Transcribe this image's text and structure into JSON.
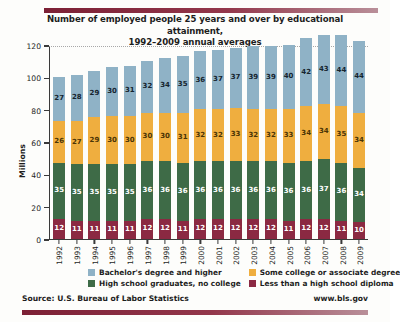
{
  "chart_data": {
    "type": "bar",
    "subtype": "stacked-column",
    "title": "Number of employed people 25 years and over by educational attainment, 1992–2009 annual averages",
    "title_line1": "Number of employed people 25 years and over by educational attainment,",
    "title_line2": "1992–2009 annual averages",
    "xlabel": "",
    "ylabel": "Millions",
    "ylim": [
      0,
      120
    ],
    "yticks": [
      0,
      20,
      40,
      60,
      80,
      100,
      120
    ],
    "ytick_labels": [
      "0",
      "20",
      "40",
      "60",
      "80",
      "100",
      "120"
    ],
    "grid": "horizontal-dotted",
    "legend_position": "bottom",
    "categories": [
      "1992",
      "1993",
      "1994",
      "1995",
      "1996",
      "1997",
      "1998",
      "1999",
      "2000",
      "2001",
      "2002",
      "2003",
      "2004",
      "2005",
      "2006",
      "2007",
      "2008",
      "2009"
    ],
    "series": [
      {
        "name": "Less than a high school diploma",
        "color": "#8b2942",
        "stack_order": 1,
        "values": [
          12,
          11,
          11,
          11,
          11,
          12,
          12,
          11,
          12,
          12,
          12,
          12,
          12,
          11,
          12,
          12,
          11,
          10
        ]
      },
      {
        "name": "High school graduates, no college",
        "color": "#3e6b47",
        "stack_order": 2,
        "values": [
          35,
          35,
          35,
          35,
          35,
          36,
          36,
          36,
          36,
          36,
          36,
          36,
          36,
          36,
          36,
          37,
          36,
          34
        ]
      },
      {
        "name": "Some college or associate degree",
        "color": "#efae3f",
        "stack_order": 3,
        "values": [
          26,
          27,
          29,
          30,
          30,
          30,
          30,
          31,
          32,
          32,
          33,
          32,
          32,
          33,
          34,
          34,
          35,
          34
        ]
      },
      {
        "name": "Bachelor's degree and higher",
        "color": "#8fb2c6",
        "stack_order": 4,
        "values": [
          27,
          28,
          29,
          30,
          31,
          32,
          34,
          35,
          36,
          37,
          37,
          39,
          39,
          40,
          42,
          43,
          44,
          44
        ]
      }
    ],
    "totals": [
      100,
      101,
      104,
      106,
      107,
      110,
      112,
      113,
      116,
      117,
      118,
      119,
      119,
      120,
      124,
      126,
      126,
      122
    ]
  },
  "legend": {
    "items": [
      {
        "label": "Bachelor's degree and higher",
        "color": "#8fb2c6"
      },
      {
        "label": "Some college or associate degree",
        "color": "#efae3f"
      },
      {
        "label": "High school graduates, no college",
        "color": "#3e6b47"
      },
      {
        "label": "Less than a high school diploma",
        "color": "#8b2942"
      }
    ]
  },
  "footer": {
    "source": "Source: U.S. Bureau of Labor Statistics",
    "url": "www.bls.gov"
  },
  "colors": {
    "rule": "#7c2035",
    "axis": "#3a3a3a",
    "text": "#1d1d1d",
    "background": "#fdfdfb"
  }
}
